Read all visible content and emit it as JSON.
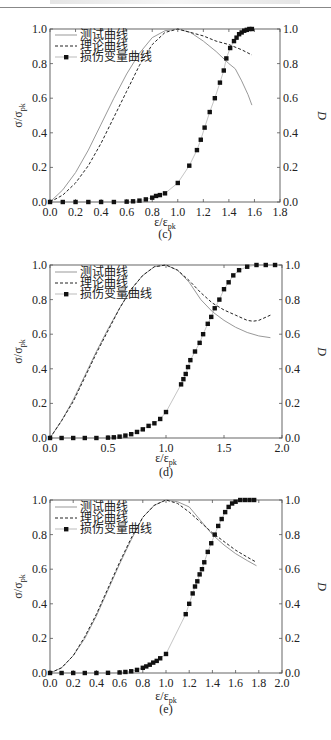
{
  "page": {
    "header_rule": true
  },
  "chart_data": [
    {
      "id": "c",
      "caption": "(c)",
      "type": "line",
      "xlabel": "ε/ε_pk",
      "ylabel_left": "σ/σ_pk",
      "ylabel_right": "D",
      "xlim": [
        0,
        1.8
      ],
      "ylim": [
        0,
        1.0
      ],
      "xticks": [
        "0.0",
        "0.2",
        "0.4",
        "0.6",
        "0.8",
        "1.0",
        "1.2",
        "1.4",
        "1.6",
        "1.8"
      ],
      "yticks_left": [
        "0.0",
        "0.2",
        "0.4",
        "0.6",
        "0.8",
        "1.0"
      ],
      "yticks_right": [
        "0.0",
        "0.2",
        "0.4",
        "0.6",
        "0.8",
        "1.0"
      ],
      "legend": [
        "测试曲线",
        "理论曲线",
        "损伤变量曲线"
      ],
      "series": [
        {
          "name": "测试曲线",
          "style": "solid-gray",
          "x": [
            0,
            0.1,
            0.2,
            0.3,
            0.4,
            0.5,
            0.6,
            0.7,
            0.8,
            0.9,
            1.0,
            1.1,
            1.2,
            1.3,
            1.4,
            1.45,
            1.5,
            1.55,
            1.58
          ],
          "y": [
            0,
            0.07,
            0.17,
            0.3,
            0.45,
            0.6,
            0.74,
            0.86,
            0.95,
            0.99,
            1.0,
            0.98,
            0.93,
            0.87,
            0.8,
            0.77,
            0.7,
            0.62,
            0.56
          ]
        },
        {
          "name": "理论曲线",
          "style": "dashed",
          "x": [
            0,
            0.1,
            0.2,
            0.3,
            0.4,
            0.5,
            0.6,
            0.7,
            0.8,
            0.9,
            1.0,
            1.1,
            1.2,
            1.3,
            1.4,
            1.5,
            1.58
          ],
          "y": [
            0,
            0.04,
            0.11,
            0.21,
            0.34,
            0.49,
            0.64,
            0.79,
            0.91,
            0.98,
            1.0,
            0.98,
            0.96,
            0.93,
            0.91,
            0.88,
            0.85
          ]
        },
        {
          "name": "损伤变量曲线",
          "style": "square-markers",
          "x": [
            0,
            0.1,
            0.2,
            0.3,
            0.4,
            0.5,
            0.6,
            0.65,
            0.7,
            0.75,
            0.8,
            0.83,
            0.86,
            0.9,
            1.0,
            1.09,
            1.15,
            1.18,
            1.21,
            1.25,
            1.29,
            1.33,
            1.36,
            1.38,
            1.41,
            1.44,
            1.46,
            1.48,
            1.5,
            1.52,
            1.54,
            1.56,
            1.58
          ],
          "y": [
            0,
            0,
            0,
            0,
            0,
            0,
            0.002,
            0.004,
            0.008,
            0.015,
            0.025,
            0.035,
            0.04,
            0.05,
            0.11,
            0.21,
            0.3,
            0.36,
            0.43,
            0.52,
            0.6,
            0.69,
            0.76,
            0.83,
            0.89,
            0.93,
            0.95,
            0.97,
            0.98,
            0.99,
            0.995,
            1.0,
            1.0
          ]
        }
      ]
    },
    {
      "id": "d",
      "caption": "(d)",
      "type": "line",
      "xlabel": "ε/ε_pk",
      "ylabel_left": "σ/σ_pk",
      "ylabel_right": "D",
      "xlim": [
        0,
        2.0
      ],
      "ylim": [
        0,
        1.0
      ],
      "xticks": [
        "0.0",
        "0.5",
        "1.0",
        "1.5",
        "2.0"
      ],
      "yticks_left": [
        "0.0",
        "0.2",
        "0.4",
        "0.6",
        "0.8",
        "1.0"
      ],
      "yticks_right": [
        "0.0",
        "0.2",
        "0.4",
        "0.6",
        "0.8",
        "1.0"
      ],
      "legend": [
        "测试曲线",
        "理论曲线",
        "损伤变量曲线"
      ],
      "series": [
        {
          "name": "测试曲线",
          "style": "solid-gray",
          "x": [
            0,
            0.1,
            0.2,
            0.3,
            0.4,
            0.5,
            0.6,
            0.7,
            0.8,
            0.9,
            1.0,
            1.1,
            1.2,
            1.3,
            1.4,
            1.5,
            1.6,
            1.7,
            1.8,
            1.9
          ],
          "y": [
            0,
            0.1,
            0.22,
            0.36,
            0.5,
            0.63,
            0.75,
            0.86,
            0.94,
            0.99,
            1.0,
            0.97,
            0.9,
            0.8,
            0.73,
            0.68,
            0.64,
            0.61,
            0.59,
            0.58
          ]
        },
        {
          "name": "理论曲线",
          "style": "dashed",
          "x": [
            0,
            0.1,
            0.2,
            0.3,
            0.4,
            0.5,
            0.6,
            0.7,
            0.8,
            0.9,
            1.0,
            1.1,
            1.2,
            1.3,
            1.4,
            1.5,
            1.6,
            1.7,
            1.75,
            1.8,
            1.9
          ],
          "y": [
            0,
            0.1,
            0.21,
            0.35,
            0.49,
            0.62,
            0.75,
            0.86,
            0.94,
            0.99,
            1.0,
            0.97,
            0.91,
            0.84,
            0.78,
            0.74,
            0.71,
            0.68,
            0.675,
            0.68,
            0.71
          ]
        },
        {
          "name": "损伤变量曲线",
          "style": "square-markers",
          "x": [
            0,
            0.1,
            0.2,
            0.3,
            0.4,
            0.5,
            0.55,
            0.6,
            0.65,
            0.7,
            0.75,
            0.8,
            0.85,
            0.9,
            0.95,
            1.0,
            1.13,
            1.15,
            1.17,
            1.19,
            1.21,
            1.25,
            1.29,
            1.32,
            1.36,
            1.39,
            1.42,
            1.46,
            1.5,
            1.54,
            1.58,
            1.63,
            1.7,
            1.78,
            1.86,
            1.94
          ],
          "y": [
            0,
            0,
            0,
            0,
            0,
            0.002,
            0.004,
            0.008,
            0.014,
            0.022,
            0.035,
            0.05,
            0.07,
            0.085,
            0.11,
            0.15,
            0.31,
            0.34,
            0.37,
            0.41,
            0.45,
            0.5,
            0.55,
            0.6,
            0.66,
            0.7,
            0.75,
            0.8,
            0.86,
            0.9,
            0.94,
            0.97,
            0.99,
            1.0,
            1.0,
            1.0
          ]
        }
      ]
    },
    {
      "id": "e",
      "caption": "(e)",
      "type": "line",
      "xlabel": "ε/ε_pk",
      "ylabel_left": "σ/σ_pk",
      "ylabel_right": "D",
      "xlim": [
        0,
        2.0
      ],
      "ylim": [
        0,
        1.0
      ],
      "xticks": [
        "0.0",
        "0.2",
        "0.4",
        "0.6",
        "0.8",
        "1.0",
        "1.2",
        "1.4",
        "1.6",
        "1.8",
        "2.0"
      ],
      "yticks_left": [
        "0.0",
        "0.2",
        "0.4",
        "0.6",
        "0.8",
        "1.0"
      ],
      "yticks_right": [
        "0.0",
        "0.2",
        "0.4",
        "0.6",
        "0.8",
        "1.0"
      ],
      "legend": [
        "测试曲线",
        "理论曲线",
        "损伤变量曲线"
      ],
      "series": [
        {
          "name": "测试曲线",
          "style": "solid-gray",
          "x": [
            0,
            0.1,
            0.2,
            0.3,
            0.4,
            0.5,
            0.6,
            0.7,
            0.8,
            0.9,
            1.0,
            1.1,
            1.2,
            1.3,
            1.4,
            1.5,
            1.6,
            1.7,
            1.78
          ],
          "y": [
            0,
            0.03,
            0.1,
            0.2,
            0.33,
            0.48,
            0.63,
            0.77,
            0.9,
            0.97,
            1.0,
            0.99,
            0.96,
            0.88,
            0.8,
            0.74,
            0.69,
            0.65,
            0.62
          ]
        },
        {
          "name": "理论曲线",
          "style": "dashed",
          "x": [
            0,
            0.1,
            0.2,
            0.3,
            0.4,
            0.5,
            0.6,
            0.7,
            0.8,
            0.9,
            1.0,
            1.1,
            1.2,
            1.3,
            1.4,
            1.5,
            1.6,
            1.7,
            1.78
          ],
          "y": [
            0,
            0.03,
            0.1,
            0.21,
            0.34,
            0.49,
            0.64,
            0.78,
            0.9,
            0.97,
            1.0,
            0.98,
            0.93,
            0.87,
            0.81,
            0.76,
            0.71,
            0.67,
            0.64
          ]
        },
        {
          "name": "损伤变量曲线",
          "style": "square-markers",
          "x": [
            0,
            0.1,
            0.2,
            0.3,
            0.4,
            0.5,
            0.6,
            0.65,
            0.7,
            0.75,
            0.8,
            0.83,
            0.86,
            0.89,
            0.92,
            0.95,
            1.0,
            1.17,
            1.2,
            1.23,
            1.25,
            1.27,
            1.29,
            1.31,
            1.33,
            1.36,
            1.39,
            1.42,
            1.45,
            1.48,
            1.51,
            1.54,
            1.57,
            1.6,
            1.64,
            1.68,
            1.72,
            1.76
          ],
          "y": [
            0,
            0,
            0,
            0,
            0,
            0.001,
            0.003,
            0.006,
            0.01,
            0.018,
            0.03,
            0.038,
            0.048,
            0.06,
            0.07,
            0.085,
            0.11,
            0.34,
            0.4,
            0.46,
            0.5,
            0.53,
            0.57,
            0.6,
            0.64,
            0.7,
            0.75,
            0.8,
            0.85,
            0.89,
            0.93,
            0.96,
            0.98,
            0.99,
            1.0,
            1.0,
            1.0,
            1.0
          ]
        }
      ]
    }
  ]
}
